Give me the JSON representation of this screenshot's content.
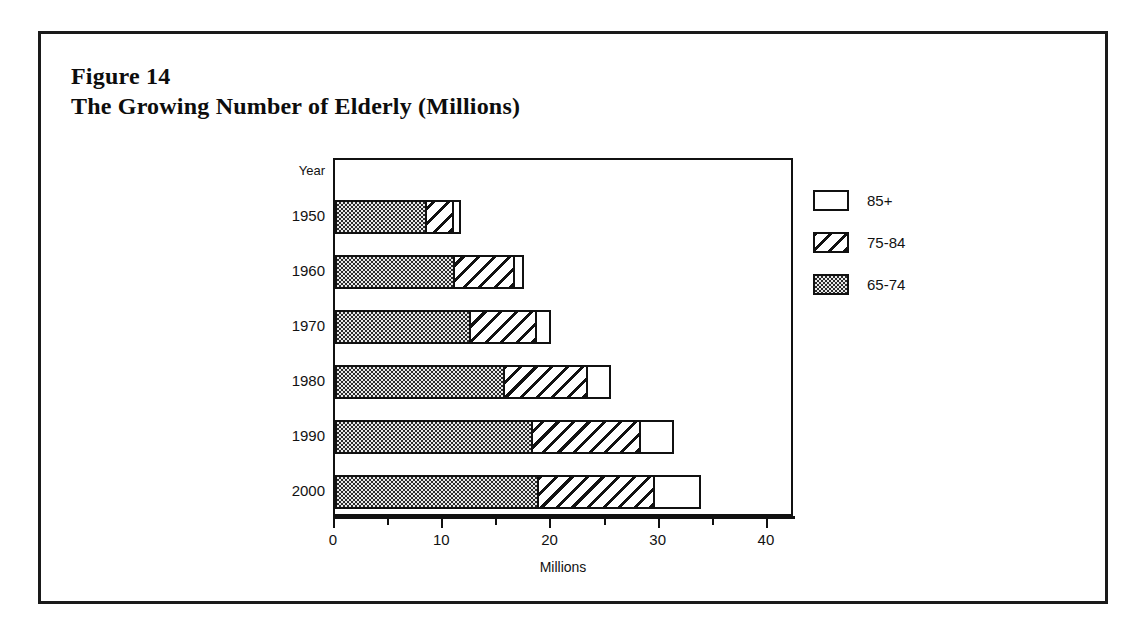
{
  "figure": {
    "label": "Figure 14",
    "title": "The Growing Number of Elderly (Millions)"
  },
  "chart_data": {
    "type": "bar",
    "orientation": "horizontal",
    "stacked": true,
    "title": "The Growing Number of Elderly (Millions)",
    "xlabel": "Millions",
    "ylabel": "Year",
    "categories": [
      "1950",
      "1960",
      "1970",
      "1980",
      "1990",
      "2000"
    ],
    "series": [
      {
        "name": "65-74",
        "values": [
          8.4,
          11.0,
          12.4,
          15.6,
          18.1,
          18.7
        ],
        "fill": "checkerboard"
      },
      {
        "name": "75-84",
        "values": [
          2.6,
          5.6,
          6.2,
          7.7,
          10.1,
          10.8
        ],
        "fill": "diagonal-hatch"
      },
      {
        "name": "85+",
        "values": [
          0.6,
          0.9,
          1.4,
          2.2,
          3.1,
          4.3
        ],
        "fill": "open"
      }
    ],
    "totals": [
      11.6,
      17.5,
      20.0,
      25.5,
      31.3,
      33.8
    ],
    "xlim": [
      0,
      42.5
    ],
    "xticks": [
      0,
      10,
      20,
      30,
      40
    ],
    "xtick_labels": [
      "0",
      "10",
      "20",
      "30",
      "40"
    ],
    "xticks_minor": [
      5,
      15,
      25,
      35
    ],
    "grid": false,
    "legend_position": "right",
    "legend_entries": [
      "85+",
      "75-84",
      "65-74"
    ]
  },
  "axes": {
    "year_axis_title": "Year",
    "x_axis_title": "Millions"
  },
  "colors": {
    "ink": "#111111",
    "paper": "#ffffff",
    "pattern_gray": "#2b2b2b"
  }
}
